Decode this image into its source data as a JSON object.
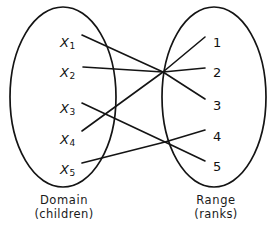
{
  "figure": {
    "domain_set": {
      "title": "Domain",
      "subtitle": "(children)",
      "elements": [
        {
          "id": "x1",
          "label": "X",
          "subscript": "1",
          "x": 60,
          "y": 36
        },
        {
          "id": "x2",
          "label": "X",
          "subscript": "2",
          "x": 60,
          "y": 66
        },
        {
          "id": "x3",
          "label": "X",
          "subscript": "3",
          "x": 60,
          "y": 102
        },
        {
          "id": "x4",
          "label": "X",
          "subscript": "4",
          "x": 60,
          "y": 133
        },
        {
          "id": "x5",
          "label": "X",
          "subscript": "5",
          "x": 60,
          "y": 163
        }
      ]
    },
    "range_set": {
      "title": "Range",
      "subtitle": "(ranks)",
      "elements": [
        {
          "id": "r1",
          "label": "1",
          "x": 213,
          "y": 36
        },
        {
          "id": "r2",
          "label": "2",
          "x": 213,
          "y": 66
        },
        {
          "id": "r3",
          "label": "3",
          "x": 213,
          "y": 99
        },
        {
          "id": "r4",
          "label": "4",
          "x": 213,
          "y": 130
        },
        {
          "id": "r5",
          "label": "5",
          "x": 213,
          "y": 160
        }
      ]
    },
    "mapping": [
      {
        "from": "x1",
        "to": "r3"
      },
      {
        "from": "x2",
        "to": "r2"
      },
      {
        "from": "x3",
        "to": "r5"
      },
      {
        "from": "x4",
        "to": "r1"
      },
      {
        "from": "x5",
        "to": "r4"
      }
    ],
    "geometry": {
      "domain_ellipse": {
        "cx": 63,
        "cy": 97,
        "rx": 53,
        "ry": 90
      },
      "range_ellipse": {
        "cx": 214,
        "cy": 97,
        "rx": 52,
        "ry": 90
      },
      "hub_upper": {
        "x": 163,
        "y": 72
      },
      "hub_lower": {
        "x": 165,
        "y": 142
      },
      "edges": [
        {
          "from": "x1",
          "to": "r3",
          "points": "82,35 163,72 205,99"
        },
        {
          "from": "x2",
          "to": "r2",
          "points": "83,67 163,72 205,68"
        },
        {
          "from": "x3",
          "to": "r5",
          "points": "82,103 165,142 205,161"
        },
        {
          "from": "x4",
          "to": "r1",
          "points": "82,131 163,72 205,37"
        },
        {
          "from": "x5",
          "to": "r4",
          "points": "82,163 165,142 205,130"
        }
      ],
      "stroke_color": "#141414",
      "stroke_width": 1.6,
      "ellipse_width": 1.7
    }
  }
}
